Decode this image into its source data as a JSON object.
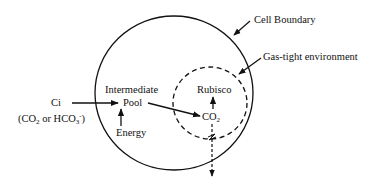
{
  "diagram": {
    "labels": {
      "cell_boundary": "Cell Boundary",
      "gas_tight": "Gas-tight environment",
      "ci": "Ci",
      "ci_paren_open": "(CO",
      "ci_sub2": "2",
      "ci_or": " or HCO",
      "ci_sub3": "3",
      "ci_sup": "-",
      "ci_paren_close": ")",
      "intermediate": "Intermediate",
      "pool": "Pool",
      "energy": "Energy",
      "rubisco": "Rubisco",
      "co2_main": "CO",
      "co2_sub": "2"
    },
    "colors": {
      "stroke": "#111111",
      "background": "#ffffff"
    }
  }
}
